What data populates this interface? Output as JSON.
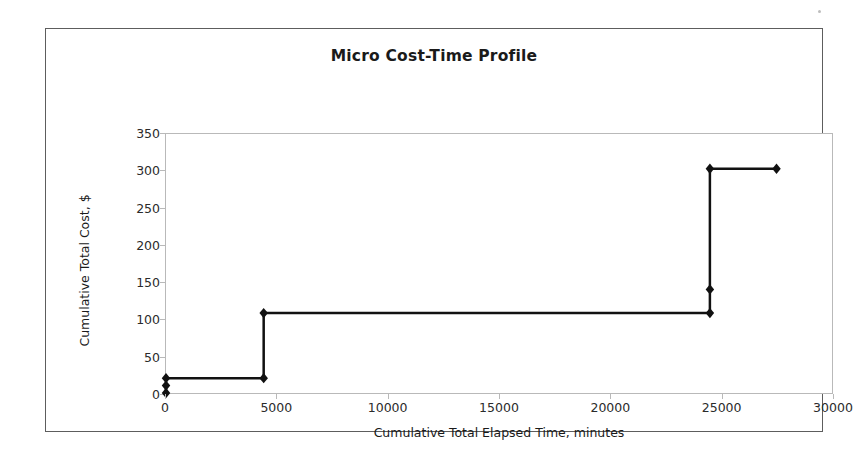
{
  "document": {
    "background_color": "#ffffff",
    "frame_color": "#5d5d5d"
  },
  "chart_data": {
    "type": "line",
    "title": "Micro Cost-Time Profile",
    "xlabel": "Cumulative Total Elapsed Time, minutes",
    "ylabel": "Cumulative Total Cost, $",
    "xlim": [
      0,
      30000
    ],
    "ylim": [
      0,
      350
    ],
    "xticks": [
      0,
      5000,
      10000,
      15000,
      20000,
      25000,
      30000
    ],
    "yticks": [
      0,
      50,
      100,
      150,
      200,
      250,
      300,
      350
    ],
    "grid": false,
    "legend": false,
    "marker": "diamond",
    "marker_color": "#111111",
    "line_color": "#111111",
    "line_width": 2.5,
    "series": [
      {
        "name": "Cumulative Total Cost",
        "x": [
          0,
          0,
          0,
          4400,
          4400,
          24500,
          24500,
          24500,
          27500
        ],
        "y": [
          0,
          10,
          20,
          20,
          108,
          108,
          140,
          303,
          303
        ]
      }
    ],
    "points": [
      {
        "x": 0,
        "y": 0
      },
      {
        "x": 0,
        "y": 10
      },
      {
        "x": 0,
        "y": 20
      },
      {
        "x": 4400,
        "y": 20
      },
      {
        "x": 4400,
        "y": 108
      },
      {
        "x": 24500,
        "y": 108
      },
      {
        "x": 24500,
        "y": 140
      },
      {
        "x": 24500,
        "y": 303
      },
      {
        "x": 27500,
        "y": 303
      }
    ]
  }
}
